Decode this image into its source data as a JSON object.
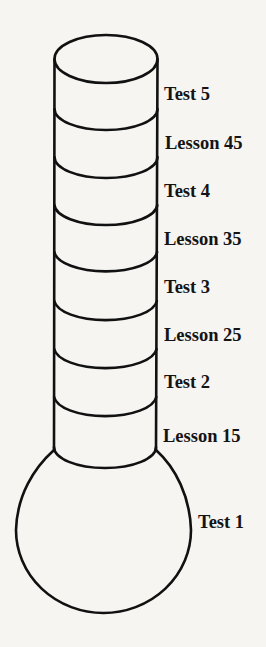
{
  "diagram": {
    "type": "thermometer-progress-chart",
    "stroke_color": "#111111",
    "background_color": "#f6f5f2",
    "segments_bottom_to_top": [
      {
        "label": "Test 1",
        "part": "bulb"
      },
      {
        "label": "Lesson 15",
        "part": "band"
      },
      {
        "label": "Test 2",
        "part": "band"
      },
      {
        "label": "Lesson 25",
        "part": "band"
      },
      {
        "label": "Test 3",
        "part": "band"
      },
      {
        "label": "Lesson 35",
        "part": "band"
      },
      {
        "label": "Test 4",
        "part": "band"
      },
      {
        "label": "Lesson 45",
        "part": "band"
      },
      {
        "label": "Test 5",
        "part": "band"
      }
    ]
  },
  "labels": {
    "test5": "Test 5",
    "lesson45": "Lesson 45",
    "test4": "Test 4",
    "lesson35": "Lesson 35",
    "test3": "Test 3",
    "lesson25": "Lesson 25",
    "test2": "Test 2",
    "lesson15": "Lesson 15",
    "test1": "Test 1"
  }
}
